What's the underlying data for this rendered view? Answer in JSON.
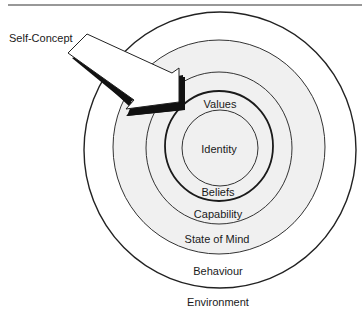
{
  "diagram": {
    "type": "nested-circles",
    "pointer_label": "Self-Concept",
    "levels": [
      {
        "id": "identity",
        "label": "Identity"
      },
      {
        "id": "values",
        "label": "Values"
      },
      {
        "id": "beliefs",
        "label": "Beliefs"
      },
      {
        "id": "capability",
        "label": "Capability"
      },
      {
        "id": "state",
        "label": "State of Mind"
      },
      {
        "id": "behaviour",
        "label": "Behaviour"
      },
      {
        "id": "environment",
        "label": "Environment"
      }
    ],
    "colors": {
      "line": "#222222",
      "inner_fill": "#f0f0f0",
      "outer_fill": "#ffffff",
      "shadow": "#111111"
    }
  }
}
